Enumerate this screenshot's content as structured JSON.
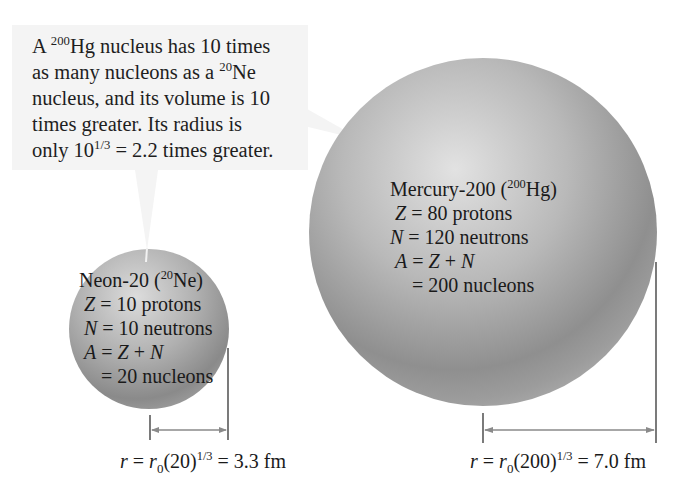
{
  "callout": {
    "lines": [
      {
        "pre": "A ",
        "sup": "200",
        "post": "Hg nucleus has 10 times"
      },
      {
        "pre": "as many nucleons as a ",
        "sup": "20",
        "post": "Ne"
      },
      {
        "pre": "nucleus, and its volume is 10",
        "sup": "",
        "post": ""
      },
      {
        "pre": "times greater. Its radius is",
        "sup": "",
        "post": ""
      },
      {
        "pre": "only 10",
        "sup": "1/3",
        "post": " = 2.2 times greater."
      }
    ]
  },
  "neon": {
    "title_pre": "Neon-20 (",
    "title_sup": "20",
    "title_post": "Ne)",
    "z_var": "Z",
    "z_text": " = 10 protons",
    "n_var": "N",
    "n_text": " = 10 neutrons",
    "a_var": "A",
    "a_eq": " = ",
    "a_z": "Z",
    "a_plus": " + ",
    "a_n": "N",
    "total": "= 20 nucleons",
    "formula": {
      "r": "r",
      "eq1": " = ",
      "r0": "r",
      "r0_sub": "0",
      "paren": "(20)",
      "exp": "1/3",
      "result": " = 3.3 fm"
    }
  },
  "mercury": {
    "title_pre": "Mercury-200 (",
    "title_sup": "200",
    "title_post": "Hg)",
    "z_var": "Z",
    "z_text": " = 80 protons",
    "n_var": "N",
    "n_text": " = 120 neutrons",
    "a_var": "A",
    "a_eq": " = ",
    "a_z": "Z",
    "a_plus": " + ",
    "a_n": "N",
    "total": "= 200 nucleons",
    "formula": {
      "r": "r",
      "eq1": " = ",
      "r0": "r",
      "r0_sub": "0",
      "paren": "(200)",
      "exp": "1/3",
      "result": " = 7.0 fm"
    }
  },
  "colors": {
    "sphere_light": "#d4d4d4",
    "sphere_mid": "#a8a8a8",
    "sphere_dark": "#7a7a7a",
    "callout_bg": "#f4f4f4",
    "dimension_line": "#888888",
    "text": "#1e1e1e"
  }
}
